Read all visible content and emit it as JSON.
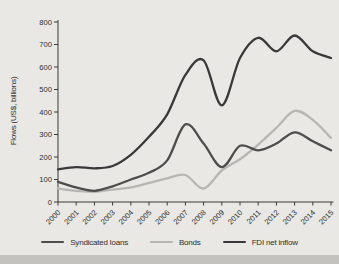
{
  "figure": {
    "y_axis_title": "Flows (US$, billions)"
  },
  "colors": {
    "background": "#e9e8e4",
    "footer_strip": "#c3c2be",
    "axis": "#3a3a38",
    "text": "#2e2e2c"
  },
  "chart_data": {
    "type": "line",
    "x": [
      2000,
      2001,
      2002,
      2003,
      2004,
      2005,
      2006,
      2007,
      2008,
      2009,
      2010,
      2011,
      2012,
      2013,
      2014,
      2015
    ],
    "series": [
      {
        "name": "Syndicated loans",
        "color": "#4d4d4b",
        "values": [
          90,
          65,
          50,
          70,
          100,
          130,
          185,
          345,
          260,
          155,
          250,
          230,
          260,
          310,
          270,
          230
        ]
      },
      {
        "name": "Bonds",
        "color": "#b7b6b2",
        "values": [
          60,
          50,
          45,
          55,
          65,
          85,
          105,
          120,
          60,
          140,
          190,
          255,
          330,
          405,
          365,
          285
        ]
      },
      {
        "name": "FDI net inflow",
        "color": "#39393a",
        "values": [
          145,
          155,
          150,
          160,
          210,
          290,
          390,
          565,
          630,
          430,
          640,
          730,
          670,
          740,
          670,
          640
        ]
      }
    ],
    "title": "",
    "xlabel": "",
    "ylabel": "Flows (US$, billions)",
    "ylim": [
      0,
      800
    ],
    "y_tick_step": 100,
    "grid": false,
    "legend_position": "bottom",
    "draw_order": [
      1,
      0,
      2
    ],
    "line_width": 2.3
  }
}
